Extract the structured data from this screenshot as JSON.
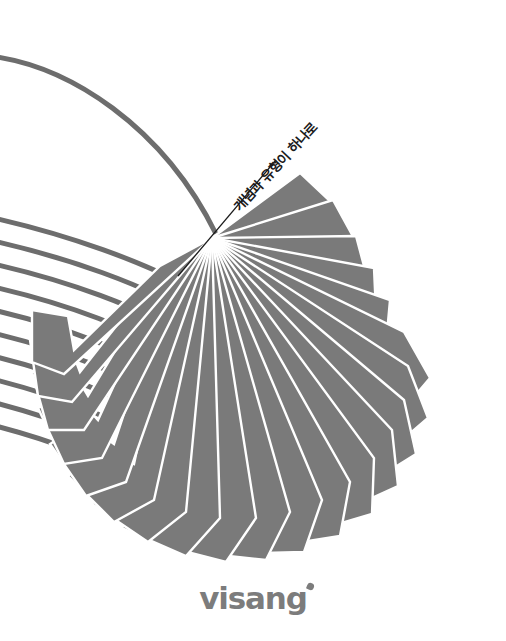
{
  "cover": {
    "width": 506,
    "height": 641,
    "background_color": "#ffffff",
    "tagline": "개념과 유형이 하나로",
    "tagline_color": "#1b1b1b",
    "pointer_line_color": "#1b1b1b"
  },
  "artwork": {
    "name": "fanned-book-pages",
    "page_fill_color": "#7a7a7a",
    "page_gap_color": "#ffffff",
    "edge_line_color": "#6d6d6d",
    "pivot_x": 212,
    "pivot_y": 238,
    "fan_page_count": 22,
    "edge_line_count": 10,
    "sweep_arc_label": "top-sweep-curve"
  },
  "logo": {
    "text": "visang",
    "color": "#7c7c7c",
    "accent_name": "visang-dot"
  }
}
